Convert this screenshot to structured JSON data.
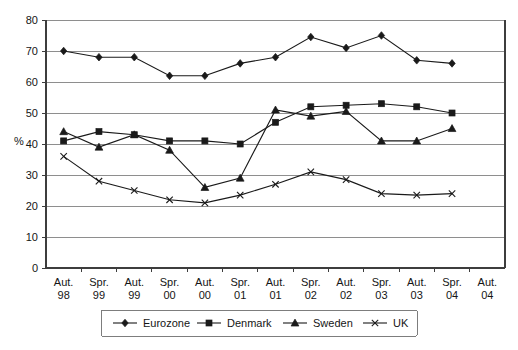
{
  "chart_data": {
    "type": "line",
    "title": "",
    "xlabel": "",
    "ylabel": "%",
    "ylim": [
      0,
      80
    ],
    "ytick_step": 10,
    "yticks": [
      "0",
      "10",
      "20",
      "30",
      "40",
      "50",
      "60",
      "70",
      "80"
    ],
    "grid": true,
    "legend_position": "bottom",
    "categories": [
      "Aut. 98",
      "Spr. 99",
      "Aut. 99",
      "Spr. 00",
      "Aut. 00",
      "Spr. 01",
      "Aut. 01",
      "Spr. 02",
      "Aut. 02",
      "Spr. 03",
      "Aut. 03",
      "Spr. 04",
      "Aut. 04"
    ],
    "category_lines": [
      [
        "Aut.",
        "98"
      ],
      [
        "Spr.",
        "99"
      ],
      [
        "Aut.",
        "99"
      ],
      [
        "Spr.",
        "00"
      ],
      [
        "Aut.",
        "00"
      ],
      [
        "Spr.",
        "01"
      ],
      [
        "Aut.",
        "01"
      ],
      [
        "Spr.",
        "02"
      ],
      [
        "Aut.",
        "02"
      ],
      [
        "Spr.",
        "03"
      ],
      [
        "Aut.",
        "03"
      ],
      [
        "Spr.",
        "04"
      ],
      [
        "Aut.",
        "04"
      ]
    ],
    "series": [
      {
        "name": "Eurozone",
        "marker": "diamond",
        "values": [
          70,
          68,
          68,
          62,
          62,
          66,
          68,
          74.5,
          71,
          75,
          67,
          66,
          null
        ]
      },
      {
        "name": "Denmark",
        "marker": "square",
        "values": [
          41,
          44,
          43,
          41,
          41,
          40,
          47,
          52,
          52.5,
          53,
          52,
          50,
          null
        ]
      },
      {
        "name": "Sweden",
        "marker": "triangle",
        "values": [
          44,
          39,
          43,
          38,
          26,
          29,
          51,
          49,
          50.5,
          41,
          41,
          45,
          null
        ]
      },
      {
        "name": "UK",
        "marker": "cross",
        "values": [
          36,
          28,
          25,
          22,
          21,
          23.5,
          27,
          31,
          28.5,
          24,
          23.5,
          24,
          null
        ]
      }
    ]
  },
  "legend": {
    "items": [
      {
        "label": "Eurozone",
        "marker": "diamond"
      },
      {
        "label": "Denmark",
        "marker": "square"
      },
      {
        "label": "Sweden",
        "marker": "triangle"
      },
      {
        "label": "UK",
        "marker": "cross"
      }
    ]
  },
  "colors": {
    "series": "#1a1a1a",
    "gridline": "#8e8e8e",
    "axis": "#3d3d3d",
    "background": "#ffffff"
  }
}
